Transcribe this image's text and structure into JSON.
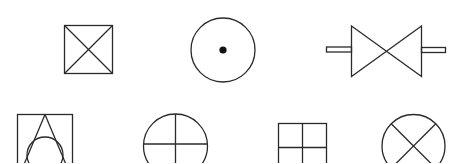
{
  "diagram": {
    "title": "",
    "stroke_color": "#2a2a2a",
    "background": "#ffffff",
    "symbols": [
      {
        "name": "square-with-x",
        "row": 1,
        "col": 1
      },
      {
        "name": "circle-with-center-dot",
        "row": 1,
        "col": 2
      },
      {
        "name": "bowtie-valve-with-stubs",
        "row": 1,
        "col": 3
      },
      {
        "name": "square-with-triangle-and-circle",
        "row": 2,
        "col": 1
      },
      {
        "name": "circle-with-cross",
        "row": 2,
        "col": 2
      },
      {
        "name": "square-grid-2x2",
        "row": 2,
        "col": 3
      },
      {
        "name": "circle-with-x",
        "row": 2,
        "col": 4
      }
    ]
  }
}
